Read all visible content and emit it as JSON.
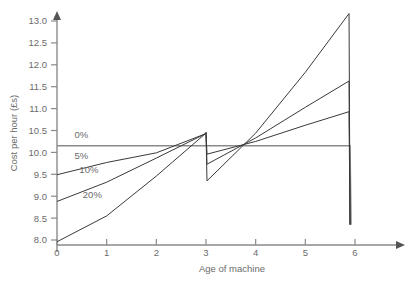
{
  "chart_data": {
    "type": "line",
    "title": "",
    "xlabel": "Age of machine",
    "ylabel": "Cost per hour (£s)",
    "xlim": [
      0,
      6.4
    ],
    "ylim": [
      7.8,
      13.35
    ],
    "grid": false,
    "legend_position": "inline-left",
    "xticks": [
      0,
      1,
      2,
      3,
      4,
      5,
      6
    ],
    "xtick_labels": [
      "0",
      "1",
      "2",
      "3",
      "4",
      "5",
      "6"
    ],
    "yticks": [
      8.0,
      8.5,
      9.0,
      9.5,
      10.0,
      10.5,
      11.0,
      11.5,
      12.0,
      12.5,
      13.0
    ],
    "ytick_labels": [
      "8.0",
      "8.5",
      "9.0",
      "9.5",
      "10.0",
      "10.5",
      "11.0",
      "11.5",
      "12.0",
      "12.5",
      "13.0"
    ],
    "annotations": [
      {
        "text": "0%",
        "x": 0.35,
        "y": 10.33
      },
      {
        "text": "5%",
        "x": 0.35,
        "y": 9.86
      },
      {
        "text": "10%",
        "x": 0.45,
        "y": 9.52
      },
      {
        "text": "20%",
        "x": 0.52,
        "y": 8.95
      }
    ],
    "series": [
      {
        "name": "0%",
        "label": "0%",
        "color": "#8a8a8a",
        "x": [
          0,
          1,
          2,
          3,
          3.02,
          4,
          5,
          5.9,
          5.92
        ],
        "values": [
          10.15,
          10.15,
          10.15,
          10.15,
          10.15,
          10.15,
          10.15,
          10.15,
          8.35
        ]
      },
      {
        "name": "5%",
        "label": "5%",
        "color": "#3a3a3a",
        "x": [
          0,
          1,
          2,
          2.98,
          3.0,
          3.02,
          4,
          5,
          5.88,
          5.9
        ],
        "values": [
          9.49,
          9.77,
          9.99,
          10.42,
          10.45,
          9.96,
          10.25,
          10.62,
          10.93,
          8.35
        ]
      },
      {
        "name": "10%",
        "label": "10%",
        "color": "#3a3a3a",
        "x": [
          0,
          1,
          2,
          2.98,
          3.0,
          3.02,
          4,
          5,
          5.88,
          5.9
        ],
        "values": [
          8.88,
          9.32,
          9.87,
          10.42,
          10.45,
          9.73,
          10.33,
          11.03,
          11.63,
          8.35
        ]
      },
      {
        "name": "20%",
        "label": "20%",
        "color": "#3a3a3a",
        "x": [
          0,
          1,
          2,
          2.98,
          3.0,
          3.02,
          4,
          5,
          5.88,
          5.9
        ],
        "values": [
          7.96,
          8.55,
          9.46,
          10.42,
          10.45,
          9.35,
          10.44,
          11.83,
          13.17,
          8.35
        ]
      }
    ]
  }
}
